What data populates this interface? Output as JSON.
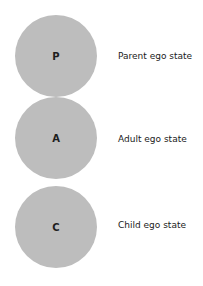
{
  "diagram": {
    "circle_color": "#bdbdbd",
    "states": [
      {
        "letter": "P",
        "label": "Parent ego state"
      },
      {
        "letter": "A",
        "label": "Adult ego state"
      },
      {
        "letter": "C",
        "label": "Child ego state"
      }
    ]
  }
}
